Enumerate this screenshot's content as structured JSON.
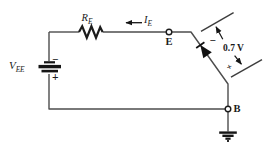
{
  "figure": {
    "background": "#ffffff",
    "wire_color": "#4d4d4d",
    "symbol_color": "#151515",
    "text_color": "#1a1a1a"
  },
  "labels": {
    "vee": {
      "base": "V",
      "sub": "EE"
    },
    "re": {
      "base": "R",
      "sub": "E"
    },
    "ie": {
      "base": "I",
      "sub": "E"
    },
    "emitter": "E",
    "base": "B",
    "diode_voltage": "0.7 V",
    "battery_minus": "−",
    "battery_plus": "+",
    "diode_minus": "−",
    "diode_plus": "+"
  },
  "components": [
    {
      "type": "battery",
      "label": "VEE",
      "polarity": "minus on top, plus on bottom"
    },
    {
      "type": "resistor",
      "label": "RE",
      "position": "top wire"
    },
    {
      "type": "current-arrow",
      "label": "IE",
      "direction": "left"
    },
    {
      "type": "open-terminal",
      "label": "E"
    },
    {
      "type": "diode",
      "orientation": "cathode toward E",
      "annotation": "0.7 V"
    },
    {
      "type": "open-terminal",
      "label": "B"
    },
    {
      "type": "earth-ground",
      "position": "below B"
    }
  ]
}
